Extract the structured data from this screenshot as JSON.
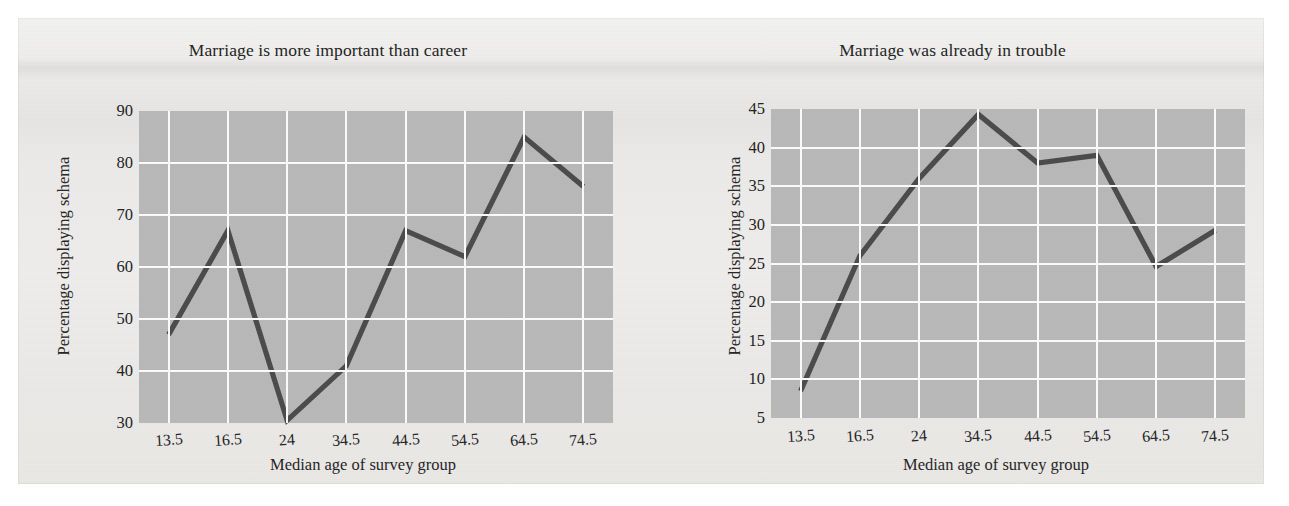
{
  "figure": {
    "background_color": "#ecebe9",
    "plot_background_color": "#b8b8b8",
    "grid_color": "#fbfbfb",
    "line_color": "#4b4b4b",
    "text_color": "#232323"
  },
  "panels": {
    "left": {
      "title": "Marriage is more important than career",
      "ylabel": "Percentage displaying schema",
      "xlabel": "Median age of survey group"
    },
    "right": {
      "title": "Marriage was already in trouble",
      "ylabel": "Percentage displaying schema",
      "xlabel": "Median age of survey group"
    }
  },
  "chart_data": [
    {
      "type": "line",
      "title": "Marriage is more important than career",
      "xlabel": "Median age of survey group",
      "ylabel": "Percentage displaying schema",
      "categories": [
        "13.5",
        "16.5",
        "24",
        "34.5",
        "44.5",
        "54.5",
        "64.5",
        "74.5"
      ],
      "x": [
        13.5,
        16.5,
        24,
        34.5,
        44.5,
        54.5,
        64.5,
        74.5
      ],
      "values": [
        47,
        67,
        30.5,
        41,
        67,
        62,
        85,
        75.5
      ],
      "ylim": [
        30,
        90
      ],
      "yticks": [
        90,
        80,
        70,
        60,
        50,
        40,
        30
      ],
      "xticks": [
        "13.5",
        "16.5",
        "24",
        "34.5",
        "44.5",
        "54.5",
        "64.5",
        "74.5"
      ],
      "grid": true,
      "legend": "none"
    },
    {
      "type": "line",
      "title": "Marriage was already in trouble",
      "xlabel": "Median age of survey group",
      "ylabel": "Percentage displaying schema",
      "categories": [
        "13.5",
        "16.5",
        "24",
        "34.5",
        "44.5",
        "54.5",
        "64.5",
        "74.5"
      ],
      "x": [
        13.5,
        16.5,
        24,
        34.5,
        44.5,
        54.5,
        64.5,
        74.5
      ],
      "values": [
        8.5,
        26,
        36,
        44.3,
        38,
        39,
        24.6,
        29.3
      ],
      "ylim": [
        5,
        45
      ],
      "yticks": [
        45,
        40,
        35,
        30,
        25,
        20,
        15,
        10,
        5
      ],
      "xticks": [
        "13.5",
        "16.5",
        "24",
        "34.5",
        "44.5",
        "54.5",
        "64.5",
        "74.5"
      ],
      "grid": true,
      "legend": "none"
    }
  ]
}
